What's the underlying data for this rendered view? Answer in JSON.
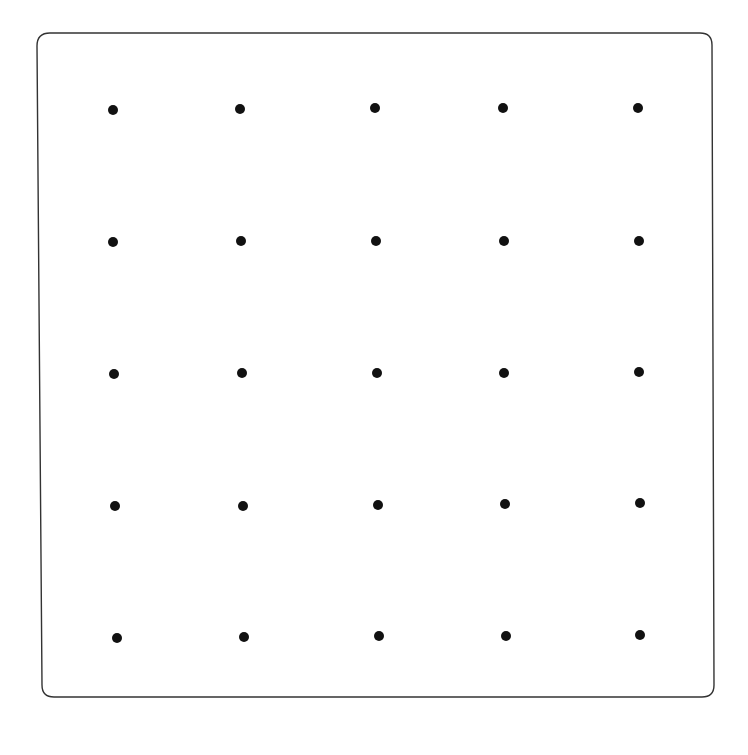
{
  "board": {
    "background": "#ffffff",
    "border_color": "#333333",
    "dot_color": "#111111",
    "dot_radius": 5,
    "rows": 5,
    "cols": 5,
    "dots": [
      [
        [
          113,
          110
        ],
        [
          240,
          109
        ],
        [
          375,
          108
        ],
        [
          503,
          108
        ],
        [
          638,
          108
        ]
      ],
      [
        [
          113,
          242
        ],
        [
          241,
          241
        ],
        [
          376,
          241
        ],
        [
          504,
          241
        ],
        [
          639,
          241
        ]
      ],
      [
        [
          114,
          374
        ],
        [
          242,
          373
        ],
        [
          377,
          373
        ],
        [
          504,
          373
        ],
        [
          639,
          372
        ]
      ],
      [
        [
          115,
          506
        ],
        [
          243,
          506
        ],
        [
          378,
          505
        ],
        [
          505,
          504
        ],
        [
          640,
          503
        ]
      ],
      [
        [
          117,
          638
        ],
        [
          244,
          637
        ],
        [
          379,
          636
        ],
        [
          506,
          636
        ],
        [
          640,
          635
        ]
      ]
    ]
  }
}
